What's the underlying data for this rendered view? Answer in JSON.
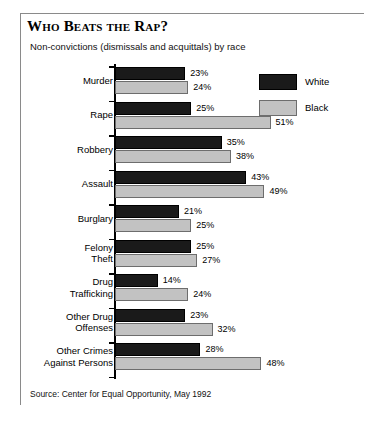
{
  "figure": {
    "title": "Who Beats the Rap?",
    "subtitle": "Non-convictions (dismissals and acquittals) by race",
    "source": "Source: Center for Equal Opportunity, May 1992"
  },
  "legend": {
    "entries": [
      {
        "label": "White",
        "color": "#1a1a1a"
      },
      {
        "label": "Black",
        "color": "#c2c2c2"
      }
    ]
  },
  "chart_data": {
    "type": "bar",
    "orientation": "horizontal",
    "title": "Who Beats the Rap?",
    "subtitle": "Non-convictions (dismissals and acquittals) by race",
    "xlabel": "",
    "ylabel": "",
    "xlim": [
      0,
      55
    ],
    "grid": false,
    "legend_position": "top-right",
    "value_suffix": "%",
    "categories": [
      "Murder",
      "Rape",
      "Robbery",
      "Assault",
      "Burglary",
      "Felony Theft",
      "Drug Trafficking",
      "Other Drug Offenses",
      "Other Crimes Against Persons"
    ],
    "category_lines": [
      [
        "Murder"
      ],
      [
        "Rape"
      ],
      [
        "Robbery"
      ],
      [
        "Assault"
      ],
      [
        "Burglary"
      ],
      [
        "Felony",
        "Theft"
      ],
      [
        "Drug",
        "Trafficking"
      ],
      [
        "Other Drug",
        "Offenses"
      ],
      [
        "Other Crimes",
        "Against Persons"
      ]
    ],
    "series": [
      {
        "name": "White",
        "color": "#1a1a1a",
        "values": [
          23,
          25,
          35,
          43,
          21,
          25,
          14,
          23,
          28
        ],
        "labels": [
          "23%",
          "25%",
          "35%",
          "43%",
          "21%",
          "25%",
          "14%",
          "23%",
          "28%"
        ]
      },
      {
        "name": "Black",
        "color": "#c2c2c2",
        "values": [
          24,
          51,
          38,
          49,
          25,
          27,
          24,
          32,
          48
        ],
        "labels": [
          "24%",
          "51%",
          "38%",
          "49%",
          "25%",
          "27%",
          "24%",
          "32%",
          "48%"
        ]
      }
    ]
  }
}
